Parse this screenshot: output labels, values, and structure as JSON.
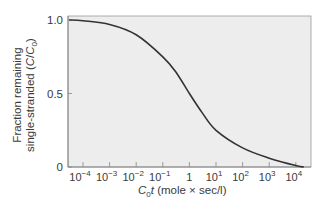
{
  "chart_data": {
    "type": "line",
    "title": "",
    "xlabel": "C0t (mole × sec/l)",
    "ylabel": "Fraction remaining single-stranded (C/C0)",
    "xscale": "log",
    "x_tick_labels": [
      "10^-4",
      "10^-3",
      "10^-2",
      "10^-1",
      "1",
      "10^1",
      "10^2",
      "10^3",
      "10^4"
    ],
    "y_tick_labels": [
      "0",
      "0.5",
      "1.0"
    ],
    "xlim": [
      3e-05,
      20000
    ],
    "ylim": [
      0,
      1.05
    ],
    "grid": false,
    "legend": null,
    "series": [
      {
        "name": "C/C0",
        "x": [
          3e-05,
          0.0001,
          0.001,
          0.01,
          0.1,
          0.3,
          1,
          3,
          10,
          100,
          1000,
          10000,
          20000
        ],
        "y": [
          1.0,
          0.995,
          0.97,
          0.9,
          0.75,
          0.65,
          0.5,
          0.37,
          0.25,
          0.13,
          0.06,
          0.01,
          0.0
        ]
      }
    ],
    "colors": {
      "line": "#333333",
      "plot_bg": "#ededed",
      "axis": "#888888"
    }
  },
  "labels": {
    "y_line1": "Fraction remaining",
    "y_line2_prefix": "single-stranded (",
    "y_C": "C",
    "y_slash": "/",
    "y_C0": "C",
    "y_sub0": "0",
    "y_line2_suffix": ")",
    "x_C": "C",
    "x_sub0": "0",
    "x_t": "t",
    "x_units": " (mole × sec/l)"
  }
}
